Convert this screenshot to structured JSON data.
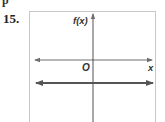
{
  "problem": {
    "number": "15.",
    "top_cutoff_text": "p"
  },
  "graph": {
    "y_axis_label": "f(x)",
    "x_axis_label": "x",
    "origin_label": "O",
    "lines": [
      {
        "description": "horizontal line below the x-axis, extends infinitely both directions",
        "type": "constant function",
        "slope": 0,
        "y_intercept_sign": "negative"
      }
    ],
    "colors": {
      "axis": "#6e6e6e",
      "line": "#555555",
      "box_border": "#c8c8c8"
    }
  }
}
